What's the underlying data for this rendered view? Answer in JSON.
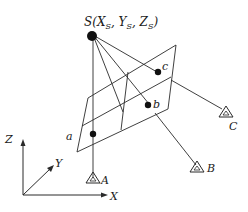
{
  "diagram": {
    "colors": {
      "stroke": "#2a2a2a",
      "fill": "#111111",
      "background": "#ffffff"
    },
    "projection_center": {
      "label": "S(X",
      "sub1": "S",
      "mid1": ", Y",
      "sub2": "S",
      "mid2": ", Z",
      "sub3": "S",
      "end": ")",
      "x": 92,
      "y": 36
    },
    "image_points": [
      {
        "label": "a",
        "x": 93,
        "y": 134
      },
      {
        "label": "b",
        "x": 149,
        "y": 104
      },
      {
        "label": "c",
        "x": 157,
        "y": 72
      }
    ],
    "ground_points": [
      {
        "label": "A",
        "x": 93,
        "y": 178
      },
      {
        "label": "B",
        "x": 196,
        "y": 167
      },
      {
        "label": "C",
        "x": 226,
        "y": 113
      }
    ],
    "axes": {
      "origin": {
        "x": 23,
        "y": 195
      },
      "x_label": "X",
      "y_label": "Y",
      "z_label": "Z"
    }
  }
}
